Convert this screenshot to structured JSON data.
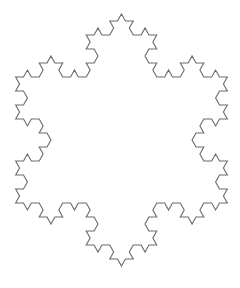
{
  "figure": {
    "iterations": 3,
    "stroke_color": "#6a6a6a",
    "background_color": "#ffffff",
    "stroke_width": 1.1,
    "center": [
      121.5,
      140
    ],
    "tip_to_tip_height": 252,
    "x_scale": 0.97,
    "orientation": "point-up"
  }
}
